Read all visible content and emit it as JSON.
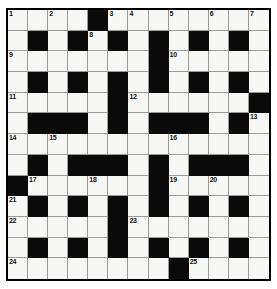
{
  "puzzle": {
    "title": "Crossword Grid",
    "type": "crossword",
    "rows": 13,
    "cols": 13,
    "colors": {
      "block": "#0a0a0a",
      "open": "#f7f7f5",
      "gridline": "#9a9a9a",
      "border": "#000000",
      "number_text": "#111111"
    },
    "blocks": [
      [
        0,
        4
      ],
      [
        1,
        1
      ],
      [
        1,
        3
      ],
      [
        1,
        5
      ],
      [
        1,
        7
      ],
      [
        1,
        9
      ],
      [
        1,
        11
      ],
      [
        2,
        7
      ],
      [
        3,
        1
      ],
      [
        3,
        3
      ],
      [
        3,
        5
      ],
      [
        3,
        7
      ],
      [
        3,
        9
      ],
      [
        3,
        11
      ],
      [
        4,
        5
      ],
      [
        4,
        12
      ],
      [
        5,
        1
      ],
      [
        5,
        2
      ],
      [
        5,
        3
      ],
      [
        5,
        5
      ],
      [
        5,
        7
      ],
      [
        5,
        8
      ],
      [
        5,
        9
      ],
      [
        5,
        11
      ],
      [
        7,
        1
      ],
      [
        7,
        3
      ],
      [
        7,
        4
      ],
      [
        7,
        5
      ],
      [
        7,
        7
      ],
      [
        7,
        9
      ],
      [
        7,
        10
      ],
      [
        7,
        11
      ],
      [
        8,
        0
      ],
      [
        8,
        7
      ],
      [
        9,
        1
      ],
      [
        9,
        3
      ],
      [
        9,
        5
      ],
      [
        9,
        7
      ],
      [
        9,
        9
      ],
      [
        9,
        11
      ],
      [
        10,
        5
      ],
      [
        11,
        1
      ],
      [
        11,
        3
      ],
      [
        11,
        5
      ],
      [
        11,
        7
      ],
      [
        11,
        9
      ],
      [
        11,
        11
      ],
      [
        12,
        8
      ]
    ],
    "numbers": [
      {
        "row": 0,
        "col": 0,
        "label": "1"
      },
      {
        "row": 0,
        "col": 2,
        "label": "2"
      },
      {
        "row": 0,
        "col": 5,
        "label": "3"
      },
      {
        "row": 0,
        "col": 6,
        "label": "4"
      },
      {
        "row": 0,
        "col": 8,
        "label": "5"
      },
      {
        "row": 0,
        "col": 10,
        "label": "6"
      },
      {
        "row": 0,
        "col": 12,
        "label": "7"
      },
      {
        "row": 1,
        "col": 4,
        "label": "8"
      },
      {
        "row": 2,
        "col": 0,
        "label": "9"
      },
      {
        "row": 2,
        "col": 8,
        "label": "10"
      },
      {
        "row": 4,
        "col": 0,
        "label": "11"
      },
      {
        "row": 4,
        "col": 6,
        "label": "12"
      },
      {
        "row": 5,
        "col": 12,
        "label": "13"
      },
      {
        "row": 6,
        "col": 0,
        "label": "14"
      },
      {
        "row": 6,
        "col": 2,
        "label": "15"
      },
      {
        "row": 6,
        "col": 8,
        "label": "16"
      },
      {
        "row": 8,
        "col": 1,
        "label": "17"
      },
      {
        "row": 8,
        "col": 4,
        "label": "18"
      },
      {
        "row": 8,
        "col": 8,
        "label": "19"
      },
      {
        "row": 8,
        "col": 10,
        "label": "20"
      },
      {
        "row": 9,
        "col": 0,
        "label": "21"
      },
      {
        "row": 10,
        "col": 0,
        "label": "22"
      },
      {
        "row": 10,
        "col": 6,
        "label": "23"
      },
      {
        "row": 12,
        "col": 0,
        "label": "24"
      },
      {
        "row": 12,
        "col": 9,
        "label": "25"
      }
    ]
  }
}
